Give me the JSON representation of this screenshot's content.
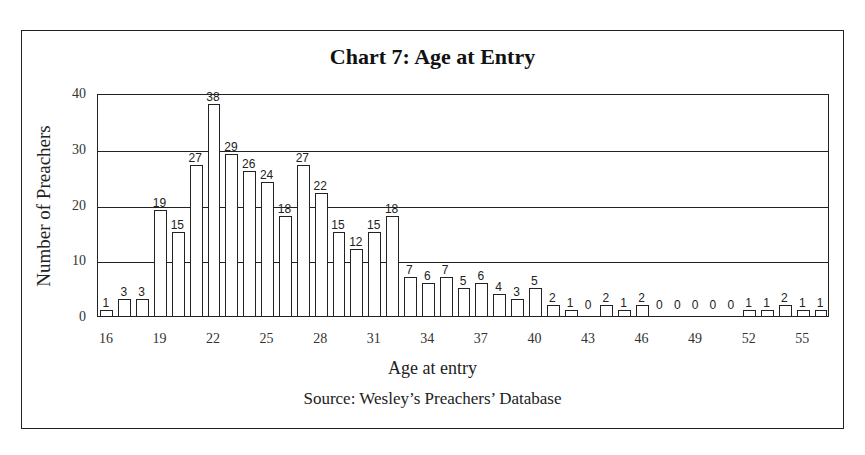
{
  "chart_data": {
    "type": "bar",
    "title": "Chart 7: Age at Entry",
    "xlabel": "Age at entry",
    "ylabel": "Number of Preachers",
    "source": "Source: Wesley’s Preachers’ Database",
    "ylim": [
      0,
      40
    ],
    "yticks": [
      0,
      10,
      20,
      30,
      40
    ],
    "xticks": [
      "16",
      "19",
      "22",
      "25",
      "28",
      "31",
      "34",
      "37",
      "40",
      "43",
      "46",
      "49",
      "52",
      "55"
    ],
    "grid": true,
    "legend": null,
    "categories": [
      16,
      17,
      18,
      19,
      20,
      21,
      22,
      23,
      24,
      25,
      26,
      27,
      28,
      29,
      30,
      31,
      32,
      33,
      34,
      35,
      36,
      37,
      38,
      39,
      40,
      41,
      42,
      43,
      44,
      45,
      46,
      47,
      48,
      49,
      50,
      51,
      52,
      53,
      54,
      55,
      56
    ],
    "values": [
      1,
      3,
      3,
      19,
      15,
      27,
      38,
      29,
      26,
      24,
      18,
      27,
      22,
      15,
      12,
      15,
      18,
      7,
      6,
      7,
      5,
      6,
      4,
      3,
      5,
      2,
      1,
      0,
      2,
      1,
      2,
      0,
      0,
      0,
      0,
      0,
      1,
      1,
      2,
      1,
      1
    ]
  },
  "labels": {
    "title": "Chart 7: Age at Entry",
    "xlabel": "Age at entry",
    "ylabel": "Number of Preachers",
    "source": "Source: Wesley’s Preachers’ Database"
  }
}
